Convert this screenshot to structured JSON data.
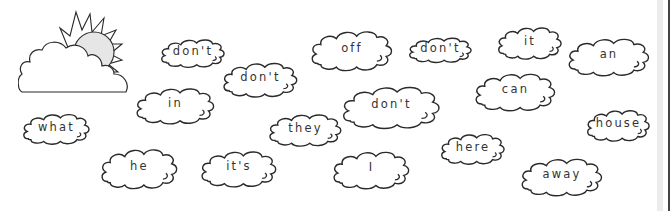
{
  "colors": {
    "outline": "#2a2a2a",
    "sun_fill": "#e6e6e6",
    "text": "#333333"
  },
  "scene": {
    "icon": "sun-behind-cloud-icon"
  },
  "words": [
    {
      "text": "don't",
      "x": 160,
      "y": 33,
      "w": 66,
      "h": 36
    },
    {
      "text": "don't",
      "x": 222,
      "y": 55,
      "w": 77,
      "h": 44
    },
    {
      "text": "off",
      "x": 310,
      "y": 22,
      "w": 84,
      "h": 51
    },
    {
      "text": "don't",
      "x": 408,
      "y": 32,
      "w": 65,
      "h": 32
    },
    {
      "text": "it",
      "x": 497,
      "y": 20,
      "w": 66,
      "h": 41
    },
    {
      "text": "an",
      "x": 567,
      "y": 30,
      "w": 84,
      "h": 48
    },
    {
      "text": "can",
      "x": 474,
      "y": 65,
      "w": 83,
      "h": 48
    },
    {
      "text": "in",
      "x": 135,
      "y": 80,
      "w": 81,
      "h": 46
    },
    {
      "text": "don't",
      "x": 341,
      "y": 77,
      "w": 101,
      "h": 54
    },
    {
      "text": "what",
      "x": 22,
      "y": 107,
      "w": 69,
      "h": 39
    },
    {
      "text": "they",
      "x": 268,
      "y": 107,
      "w": 75,
      "h": 41
    },
    {
      "text": "house",
      "x": 586,
      "y": 103,
      "w": 65,
      "h": 40
    },
    {
      "text": "here",
      "x": 440,
      "y": 127,
      "w": 66,
      "h": 39
    },
    {
      "text": "he",
      "x": 100,
      "y": 140,
      "w": 79,
      "h": 51
    },
    {
      "text": "it's",
      "x": 200,
      "y": 143,
      "w": 78,
      "h": 46
    },
    {
      "text": "I",
      "x": 332,
      "y": 143,
      "w": 79,
      "h": 48
    },
    {
      "text": "away",
      "x": 520,
      "y": 150,
      "w": 84,
      "h": 48
    }
  ]
}
